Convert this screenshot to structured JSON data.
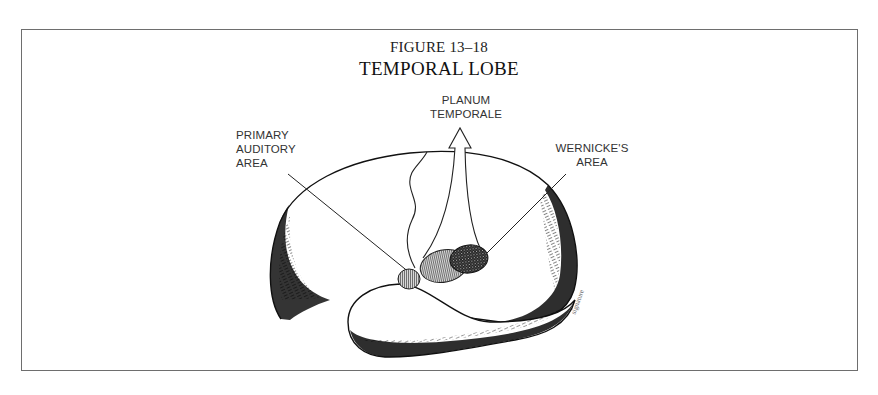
{
  "figure": {
    "number": "FIGURE 13–18",
    "title": "TEMPORAL LOBE"
  },
  "labels": {
    "primary_auditory_area": [
      "PRIMARY",
      "AUDITORY",
      "AREA"
    ],
    "planum_temporale": [
      "PLANUM",
      "TEMPORALE"
    ],
    "wernickes_area": [
      "WERNICKE'S",
      "AREA"
    ]
  },
  "illustration": {
    "subject": "brain-temporal-lobe",
    "regions": [
      {
        "name": "primary-auditory-area",
        "fill": "vertical-hatch"
      },
      {
        "name": "planum-temporale",
        "fill": "vertical-hatch"
      },
      {
        "name": "wernickes-area",
        "fill": "crosshatch-dark"
      }
    ],
    "artist_signature": "signature"
  },
  "colors": {
    "ink": "#111111",
    "frame": "#6e6e6e",
    "background": "#ffffff"
  }
}
